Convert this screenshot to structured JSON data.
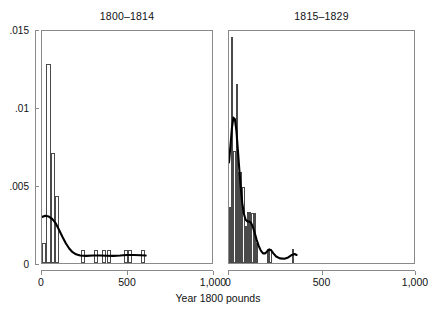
{
  "chart_data": {
    "type": "bar",
    "title": "",
    "xlabel": "Year 1800 pounds",
    "ylabel": "",
    "xlim": [
      0,
      1000
    ],
    "ylim": [
      0,
      0.015
    ],
    "grid": false,
    "legend": "none",
    "xticks": [
      0,
      500,
      1000
    ],
    "xticklabels": [
      "0",
      "500",
      "1,000"
    ],
    "yticks": [
      0,
      0.005,
      0.01,
      0.015
    ],
    "yticklabels": [
      "0",
      ".005",
      ".01",
      ".015"
    ],
    "panels": [
      {
        "label": "1800–1814",
        "bar_width": 25,
        "bars": [
          {
            "x0": 0,
            "x1": 25,
            "height": 0.00128
          },
          {
            "x0": 25,
            "x1": 50,
            "height": 0.01278
          },
          {
            "x0": 50,
            "x1": 75,
            "height": 0.00705
          },
          {
            "x0": 75,
            "x1": 100,
            "height": 0.00427
          },
          {
            "x0": 225,
            "x1": 250,
            "height": 0.00085
          },
          {
            "x0": 300,
            "x1": 325,
            "height": 0.00085
          },
          {
            "x0": 350,
            "x1": 375,
            "height": 0.00085
          },
          {
            "x0": 375,
            "x1": 400,
            "height": 0.00085
          },
          {
            "x0": 475,
            "x1": 500,
            "height": 0.00085
          },
          {
            "x0": 500,
            "x1": 525,
            "height": 0.00085
          },
          {
            "x0": 575,
            "x1": 600,
            "height": 0.00085
          }
        ],
        "density": [
          {
            "x": 0,
            "y": 0.00298
          },
          {
            "x": 20,
            "y": 0.00305
          },
          {
            "x": 40,
            "y": 0.003
          },
          {
            "x": 60,
            "y": 0.00285
          },
          {
            "x": 80,
            "y": 0.00258
          },
          {
            "x": 100,
            "y": 0.00215
          },
          {
            "x": 120,
            "y": 0.0017
          },
          {
            "x": 140,
            "y": 0.00128
          },
          {
            "x": 160,
            "y": 0.00094
          },
          {
            "x": 180,
            "y": 0.0007
          },
          {
            "x": 200,
            "y": 0.00056
          },
          {
            "x": 225,
            "y": 0.00048
          },
          {
            "x": 260,
            "y": 0.00046
          },
          {
            "x": 300,
            "y": 0.00048
          },
          {
            "x": 340,
            "y": 0.00048
          },
          {
            "x": 380,
            "y": 0.00047
          },
          {
            "x": 420,
            "y": 0.00046
          },
          {
            "x": 460,
            "y": 0.00048
          },
          {
            "x": 500,
            "y": 0.00052
          },
          {
            "x": 540,
            "y": 0.00052
          },
          {
            "x": 580,
            "y": 0.0005
          },
          {
            "x": 610,
            "y": 0.00048
          }
        ]
      },
      {
        "label": "1815–1829",
        "bar_width": 12,
        "bars": [
          {
            "x0": 0,
            "x1": 12,
            "height": 0.0036
          },
          {
            "x0": 12,
            "x1": 24,
            "height": 0.01452
          },
          {
            "x0": 24,
            "x1": 36,
            "height": 0.0072
          },
          {
            "x0": 36,
            "x1": 48,
            "height": 0.0115
          },
          {
            "x0": 48,
            "x1": 60,
            "height": 0.00585
          },
          {
            "x0": 60,
            "x1": 72,
            "height": 0.00585
          },
          {
            "x0": 72,
            "x1": 84,
            "height": 0.0049
          },
          {
            "x0": 84,
            "x1": 96,
            "height": 0.0024
          },
          {
            "x0": 96,
            "x1": 108,
            "height": 0.0033
          },
          {
            "x0": 108,
            "x1": 120,
            "height": 0.0033
          },
          {
            "x0": 120,
            "x1": 132,
            "height": 0.0032
          },
          {
            "x0": 132,
            "x1": 144,
            "height": 0.0032
          },
          {
            "x0": 144,
            "x1": 156,
            "height": 0.0013
          },
          {
            "x0": 204,
            "x1": 216,
            "height": 0.00092
          },
          {
            "x0": 216,
            "x1": 228,
            "height": 0.00092
          },
          {
            "x0": 336,
            "x1": 348,
            "height": 0.00092
          }
        ],
        "density": [
          {
            "x": 0,
            "y": 0.0065
          },
          {
            "x": 8,
            "y": 0.0076
          },
          {
            "x": 16,
            "y": 0.00875
          },
          {
            "x": 24,
            "y": 0.0094
          },
          {
            "x": 32,
            "y": 0.0093
          },
          {
            "x": 40,
            "y": 0.00855
          },
          {
            "x": 48,
            "y": 0.0073
          },
          {
            "x": 56,
            "y": 0.006
          },
          {
            "x": 64,
            "y": 0.0048
          },
          {
            "x": 72,
            "y": 0.00385
          },
          {
            "x": 80,
            "y": 0.0032
          },
          {
            "x": 90,
            "y": 0.0028
          },
          {
            "x": 100,
            "y": 0.00268
          },
          {
            "x": 110,
            "y": 0.00268
          },
          {
            "x": 120,
            "y": 0.00258
          },
          {
            "x": 130,
            "y": 0.0023
          },
          {
            "x": 140,
            "y": 0.0019
          },
          {
            "x": 150,
            "y": 0.00148
          },
          {
            "x": 160,
            "y": 0.00112
          },
          {
            "x": 172,
            "y": 0.0008
          },
          {
            "x": 184,
            "y": 0.00062
          },
          {
            "x": 196,
            "y": 0.00062
          },
          {
            "x": 208,
            "y": 0.00078
          },
          {
            "x": 218,
            "y": 0.00088
          },
          {
            "x": 228,
            "y": 0.00082
          },
          {
            "x": 240,
            "y": 0.00062
          },
          {
            "x": 255,
            "y": 0.00042
          },
          {
            "x": 275,
            "y": 0.0003
          },
          {
            "x": 300,
            "y": 0.00028
          },
          {
            "x": 320,
            "y": 0.00036
          },
          {
            "x": 340,
            "y": 0.00052
          },
          {
            "x": 355,
            "y": 0.00058
          },
          {
            "x": 365,
            "y": 0.00052
          }
        ]
      }
    ]
  },
  "axis": {
    "x_title": "Year 1800 pounds"
  },
  "colors": {
    "bar_edge": "#4a4a4a",
    "bar_fill": "#ffffff",
    "curve": "#000000",
    "frame": "#8a8a8a",
    "text": "#111111",
    "background": "#ffffff"
  }
}
